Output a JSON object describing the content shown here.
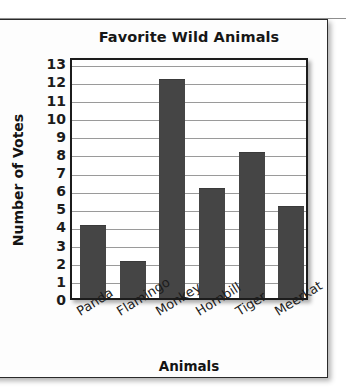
{
  "chart_data": {
    "type": "bar",
    "title": "Favorite Wild Animals",
    "xlabel": "Animals",
    "ylabel": "Number of Votes",
    "categories": [
      "Panda",
      "Flamingo",
      "Monkey",
      "Hornbill",
      "Tiger",
      "Meerkat"
    ],
    "values": [
      4,
      2,
      12,
      6,
      8,
      5
    ],
    "ylim": [
      0,
      13
    ],
    "ytick_labels": [
      "13",
      "12",
      "11",
      "10",
      "9",
      "8",
      "7",
      "6",
      "5",
      "4",
      "3",
      "2",
      "1",
      "0"
    ],
    "ytick_values": [
      13,
      12,
      11,
      10,
      9,
      8,
      7,
      6,
      5,
      4,
      3,
      2,
      1,
      0
    ],
    "grid": true,
    "legend": false,
    "bar_color": "#454545",
    "grid_color": "#9a9a9a",
    "axis_color": "#1c1c1c",
    "background_color": "#ffffff"
  }
}
